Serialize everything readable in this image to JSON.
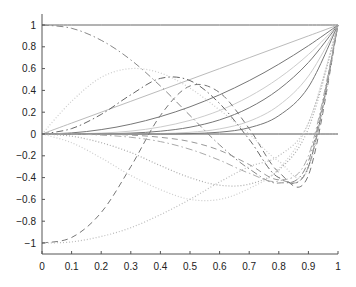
{
  "chart_data": {
    "type": "line",
    "title": "",
    "xlabel": "",
    "ylabel": "",
    "xlim": [
      0,
      1
    ],
    "ylim": [
      -1.1,
      1.1
    ],
    "grid": false,
    "legend": null,
    "x_ticks": [
      "0",
      "0.1",
      "0.2",
      "0.3",
      "0.4",
      "0.5",
      "0.6",
      "0.7",
      "0.8",
      "0.9",
      "1"
    ],
    "y_ticks": [
      "1",
      "0.8",
      "0.6",
      "0.4",
      "0.2",
      "0",
      "-0.2",
      "-0.4",
      "-0.6",
      "-0.8",
      "-1"
    ],
    "x": [
      0,
      0.1,
      0.2,
      0.3,
      0.4,
      0.5,
      0.6,
      0.7,
      0.8,
      0.9,
      1.0
    ],
    "series": [
      {
        "name": "constant-one",
        "style": "solid",
        "color": "#666666",
        "values": [
          1,
          1,
          1,
          1,
          1,
          1,
          1,
          1,
          1,
          1,
          1
        ]
      },
      {
        "name": "constant-zero",
        "style": "solid",
        "color": "#555555",
        "values": [
          0,
          0,
          0,
          0,
          0,
          0,
          0,
          0,
          0,
          0,
          0
        ]
      },
      {
        "name": "power-1",
        "style": "solid",
        "color": "#bbbbbb",
        "values": [
          0,
          0.1,
          0.2,
          0.3,
          0.4,
          0.5,
          0.6,
          0.7,
          0.8,
          0.9,
          1
        ]
      },
      {
        "name": "power-2",
        "style": "solid",
        "color": "#777777",
        "values": [
          0,
          0.01,
          0.04,
          0.09,
          0.16,
          0.25,
          0.36,
          0.49,
          0.64,
          0.81,
          1
        ]
      },
      {
        "name": "power-3",
        "style": "solid",
        "color": "#cccccc",
        "values": [
          0,
          0.001,
          0.008,
          0.027,
          0.064,
          0.125,
          0.216,
          0.343,
          0.512,
          0.729,
          1
        ]
      },
      {
        "name": "power-4",
        "style": "solid",
        "color": "#777777",
        "values": [
          0,
          0.0001,
          0.0016,
          0.0081,
          0.0256,
          0.0625,
          0.1296,
          0.2401,
          0.4096,
          0.6561,
          1
        ]
      },
      {
        "name": "power-6",
        "style": "solid",
        "color": "#cccccc",
        "values": [
          0,
          0,
          0.0001,
          0.0007,
          0.0041,
          0.0156,
          0.0467,
          0.1176,
          0.2621,
          0.5314,
          1
        ]
      },
      {
        "name": "power-8",
        "style": "solid",
        "color": "#777777",
        "values": [
          0,
          0,
          0,
          0.0001,
          0.0007,
          0.0039,
          0.0168,
          0.0576,
          0.1678,
          0.4305,
          1
        ]
      },
      {
        "name": "dashdot-descending",
        "style": "dashdot",
        "color": "#888888",
        "values": [
          1,
          0.97,
          0.86,
          0.68,
          0.44,
          0.17,
          -0.1,
          -0.32,
          -0.45,
          -0.25,
          1
        ]
      },
      {
        "name": "dashdot-hump",
        "style": "dashdot",
        "color": "#666666",
        "values": [
          0,
          0.05,
          0.18,
          0.36,
          0.51,
          0.49,
          0.28,
          -0.05,
          -0.4,
          -0.3,
          1
        ]
      },
      {
        "name": "dashed-rising",
        "style": "dashed",
        "color": "#777777",
        "values": [
          -1,
          -0.95,
          -0.72,
          -0.3,
          0.17,
          0.44,
          0.38,
          0.05,
          -0.35,
          -0.38,
          1
        ]
      },
      {
        "name": "dotted-hump",
        "style": "dotted",
        "color": "#cccccc",
        "values": [
          0,
          0.3,
          0.52,
          0.6,
          0.56,
          0.42,
          0.22,
          0.0,
          -0.25,
          -0.32,
          1
        ]
      },
      {
        "name": "dotted-valley",
        "style": "dotted",
        "color": "#aaaaaa",
        "values": [
          0,
          -0.02,
          -0.08,
          -0.17,
          -0.29,
          -0.4,
          -0.47,
          -0.46,
          -0.33,
          0.05,
          1
        ]
      },
      {
        "name": "dotted-descending",
        "style": "dotted",
        "color": "#cccccc",
        "values": [
          0,
          -0.08,
          -0.22,
          -0.38,
          -0.51,
          -0.6,
          -0.6,
          -0.5,
          -0.32,
          0.1,
          1
        ]
      },
      {
        "name": "dotted-rising",
        "style": "dotted",
        "color": "#bbbbbb",
        "values": [
          -1,
          -0.99,
          -0.94,
          -0.86,
          -0.74,
          -0.6,
          -0.44,
          -0.3,
          -0.2,
          0.1,
          1
        ]
      },
      {
        "name": "dashdot-steep",
        "style": "dashdot",
        "color": "#aaaaaa",
        "values": [
          0,
          0,
          -0.01,
          -0.03,
          -0.07,
          -0.14,
          -0.24,
          -0.36,
          -0.43,
          -0.2,
          1
        ]
      },
      {
        "name": "dashed-steep",
        "style": "dashed",
        "color": "#999999",
        "values": [
          0,
          0,
          0,
          -0.01,
          -0.03,
          -0.07,
          -0.15,
          -0.28,
          -0.42,
          -0.3,
          1
        ]
      }
    ]
  }
}
